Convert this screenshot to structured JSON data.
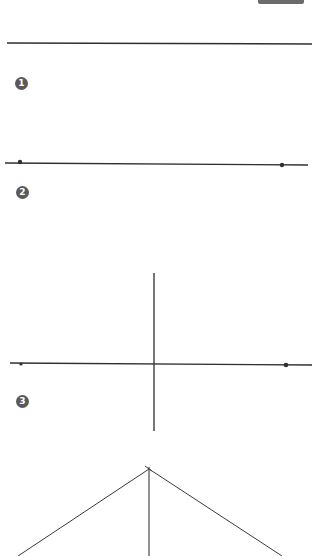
{
  "diagram": {
    "title": "",
    "steps": [
      {
        "badge": "1",
        "description": "single straight line"
      },
      {
        "badge": "2",
        "description": "line with end points marked"
      },
      {
        "badge": "3",
        "description": "perpendicular line through center"
      },
      {
        "badge": "4",
        "description": "lines from endpoints to top of perpendicular"
      }
    ],
    "colors": {
      "line": "#2f2f2f",
      "badge_bg": "#5a5a5a",
      "badge_text": "#ffffff",
      "background": "#ffffff"
    }
  }
}
